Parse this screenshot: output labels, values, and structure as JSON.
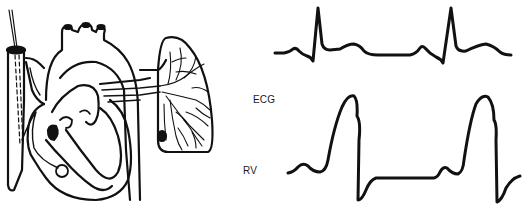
{
  "figure": {
    "ink_color": "#111111",
    "background": "#ffffff"
  },
  "labels": {
    "ecg": "ECG",
    "rv": "RV"
  },
  "anatomy": {
    "parts": [
      "superior-vena-cava",
      "catheter",
      "aortic-arch",
      "pulmonary-artery",
      "right-atrium",
      "right-ventricle",
      "left-ventricle",
      "catheter-balloon-tip",
      "lung"
    ]
  },
  "traces": {
    "ecg": {
      "name": "ECG",
      "beats": 2,
      "features": [
        "P",
        "QRS",
        "T"
      ]
    },
    "rv": {
      "name": "RV pressure",
      "beats": 2,
      "features": [
        "a-wave",
        "systolic-peak",
        "diastolic-trough"
      ]
    }
  }
}
